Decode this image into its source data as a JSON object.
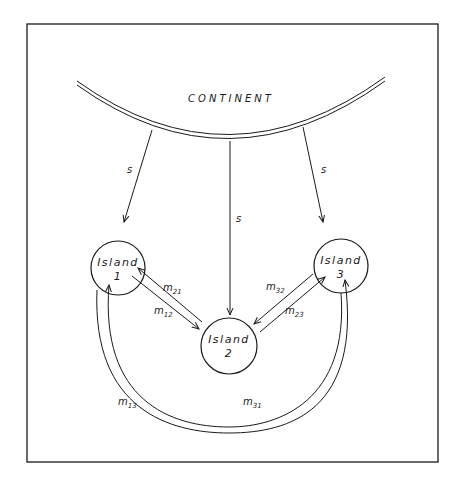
{
  "diagram": {
    "continent_label": "CONTINENT",
    "islands": [
      {
        "id": 1,
        "name": "Island",
        "number": "1"
      },
      {
        "id": 2,
        "name": "Island",
        "number": "2"
      },
      {
        "id": 3,
        "name": "Island",
        "number": "3"
      }
    ],
    "flows": {
      "continent_to_island1": "s",
      "continent_to_island2": "s",
      "continent_to_island3": "s",
      "m21": {
        "sym": "m",
        "sub": "21"
      },
      "m12": {
        "sym": "m",
        "sub": "12"
      },
      "m32": {
        "sym": "m",
        "sub": "32"
      },
      "m23": {
        "sym": "m",
        "sub": "23"
      },
      "m13": {
        "sym": "m",
        "sub": "13"
      },
      "m31": {
        "sym": "m",
        "sub": "31"
      }
    }
  },
  "colors": {
    "line": "#1a1a1a",
    "background": "#ffffff"
  }
}
